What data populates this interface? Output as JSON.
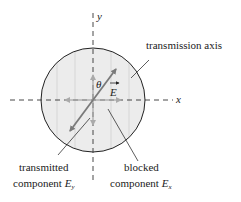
{
  "labels": {
    "y_axis": "y",
    "x_axis": "x",
    "theta": "θ",
    "e_field": "E",
    "transmission_axis": "transmission axis",
    "transmitted_line1": "transmitted",
    "transmitted_line2": "component ",
    "transmitted_symbol": "E",
    "transmitted_sub": "y",
    "blocked_line1": "blocked",
    "blocked_line2": "component ",
    "blocked_symbol": "E",
    "blocked_sub": "x"
  },
  "colors": {
    "disk_fill": "#ececec",
    "disk_stroke": "#222222",
    "axis": "#333333",
    "e_vector": "#7a7a7a",
    "component_arrows": "#aaaaaa",
    "grating_lines": "#d0d0d0",
    "leader_lines": "#333333"
  }
}
